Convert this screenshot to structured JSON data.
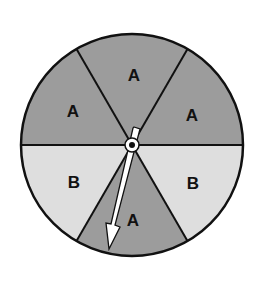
{
  "spinner": {
    "sections": [
      {
        "label": "A",
        "shade": "dark",
        "position": "top"
      },
      {
        "label": "A",
        "shade": "dark",
        "position": "upper-right"
      },
      {
        "label": "B",
        "shade": "light",
        "position": "lower-right"
      },
      {
        "label": "A",
        "shade": "dark",
        "position": "bottom"
      },
      {
        "label": "B",
        "shade": "light",
        "position": "lower-left"
      },
      {
        "label": "A",
        "shade": "dark",
        "position": "upper-left"
      }
    ],
    "colors": {
      "dark": "#9c9c9c",
      "light": "#dedede",
      "outline": "#111111",
      "arrow": "#ffffff"
    },
    "arrow_points_to": "A"
  }
}
